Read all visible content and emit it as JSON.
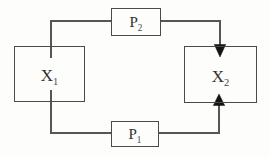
{
  "diagram": {
    "title": "",
    "background_color": "#fdfdfc",
    "line_color": "#565656",
    "box_border_color": "#4a4a4a",
    "arrow_color": "#141414",
    "text_color": "#333231",
    "nodes": [
      {
        "id": "X1",
        "base": "X",
        "sub": "1",
        "shape": "rectangle",
        "position": "left"
      },
      {
        "id": "X2",
        "base": "X",
        "sub": "2",
        "shape": "rectangle",
        "position": "right"
      },
      {
        "id": "P2",
        "base": "P",
        "sub": "2",
        "shape": "rectangle",
        "position": "top-center"
      },
      {
        "id": "P1",
        "base": "P",
        "sub": "1",
        "shape": "rectangle",
        "position": "bottom-center"
      }
    ],
    "edges": [
      {
        "from": "X1",
        "to": "P2",
        "arrow": false,
        "route": "up from X1 top, right into P2 left side"
      },
      {
        "from": "P2",
        "to": "X2",
        "arrow": true,
        "route": "right from P2, down into X2 top with filled arrowhead"
      },
      {
        "from": "X1",
        "to": "P1",
        "arrow": false,
        "route": "down from X1 bottom, right into P1 left side"
      },
      {
        "from": "P1",
        "to": "X2",
        "arrow": true,
        "route": "right from P1, up into X2 bottom with filled arrowhead"
      }
    ]
  }
}
